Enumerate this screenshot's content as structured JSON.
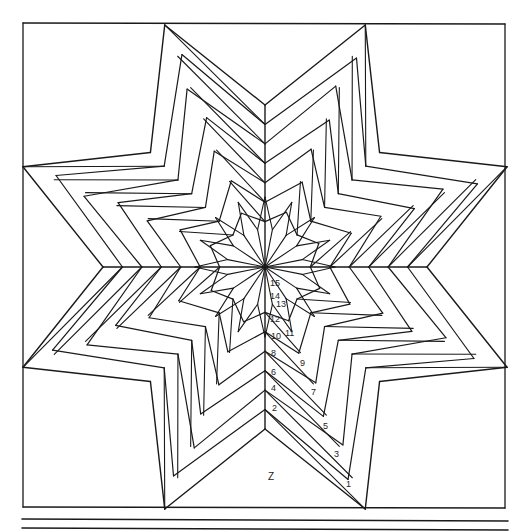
{
  "diagram": {
    "type": "quilt-star-pattern",
    "stroke_color": "#1a1a1a",
    "background": "#ffffff",
    "section_label": "Z",
    "sequence_labels": [
      {
        "text": "1",
        "x": 346,
        "y": 487
      },
      {
        "text": "2",
        "x": 272,
        "y": 411
      },
      {
        "text": "3",
        "x": 334,
        "y": 457
      },
      {
        "text": "4",
        "x": 271,
        "y": 391
      },
      {
        "text": "5",
        "x": 323,
        "y": 429
      },
      {
        "text": "6",
        "x": 271,
        "y": 375
      },
      {
        "text": "7",
        "x": 311,
        "y": 395
      },
      {
        "text": "8",
        "x": 271,
        "y": 356
      },
      {
        "text": "9",
        "x": 300,
        "y": 366
      },
      {
        "text": "10",
        "x": 271,
        "y": 339
      },
      {
        "text": "11",
        "x": 285,
        "y": 336
      },
      {
        "text": "12",
        "x": 270,
        "y": 322
      },
      {
        "text": "13",
        "x": 276,
        "y": 307
      },
      {
        "text": "14",
        "x": 270,
        "y": 299
      },
      {
        "text": "15",
        "x": 270,
        "y": 286
      }
    ]
  }
}
